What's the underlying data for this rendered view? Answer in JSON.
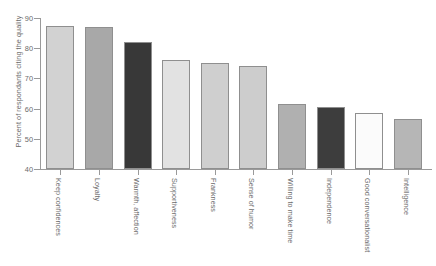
{
  "chart_data": {
    "type": "bar",
    "title": "",
    "xlabel": "",
    "ylabel": "Percent of respondants citing the quality",
    "ylim": [
      40,
      90
    ],
    "yticks": [
      40,
      50,
      60,
      70,
      80,
      90
    ],
    "grid": false,
    "legend": null,
    "categories": [
      "Keep confidences",
      "Loyalty",
      "Warmth, affection",
      "Supportiveness",
      "Frankness",
      "Sense of humor",
      "Willing to make time",
      "Independence",
      "Good conversationalist",
      "Intelligence"
    ],
    "values": [
      87.5,
      87,
      82,
      76,
      75,
      74,
      61.5,
      60.5,
      58.5,
      56.5
    ],
    "bar_colors": [
      "#d2d2d2",
      "#a8a8a8",
      "#383838",
      "#e2e2e2",
      "#cfcfcf",
      "#cdcdcd",
      "#b0b0b0",
      "#3d3d3d",
      "#fbfbfb",
      "#b6b6b6"
    ],
    "bar_edge_color": "#8f8f8f",
    "axis_color": "#9a9a9a",
    "text_color": "#6b6b6b",
    "background": "#ffffff"
  },
  "axis": {
    "y_title": "Percent of respondants citing the quality",
    "y_tick_labels": [
      "40",
      "50",
      "60",
      "70",
      "80",
      "90"
    ]
  }
}
